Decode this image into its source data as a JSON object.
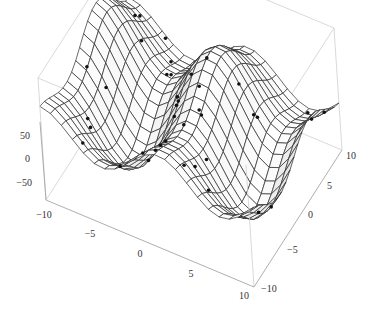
{
  "chart_data": {
    "type": "surface3d",
    "title": "",
    "xlabel": "",
    "ylabel": "",
    "zlabel": "",
    "x_range": [
      -10,
      10
    ],
    "y_range": [
      -10,
      10
    ],
    "z_range": [
      -75,
      75
    ],
    "x_ticks": [
      -10,
      -5,
      0,
      5,
      10
    ],
    "y_ticks": [
      -10,
      -5,
      0,
      5,
      10
    ],
    "z_ticks": [
      -50,
      0,
      50
    ],
    "mesh": true,
    "mesh_lines": 20,
    "surface_color": "#e6e6e6",
    "mesh_color": "#2a2a2a",
    "box_color": "#cfcfcf",
    "point_color": "#111111",
    "points_count": 40
  },
  "axes": {
    "z_labels": [
      "50",
      "0",
      "−50"
    ],
    "x_labels": [
      "−10",
      "−5",
      "0",
      "5",
      "10"
    ],
    "y_labels": [
      "10",
      "5",
      "0",
      "−5",
      "−10"
    ]
  }
}
